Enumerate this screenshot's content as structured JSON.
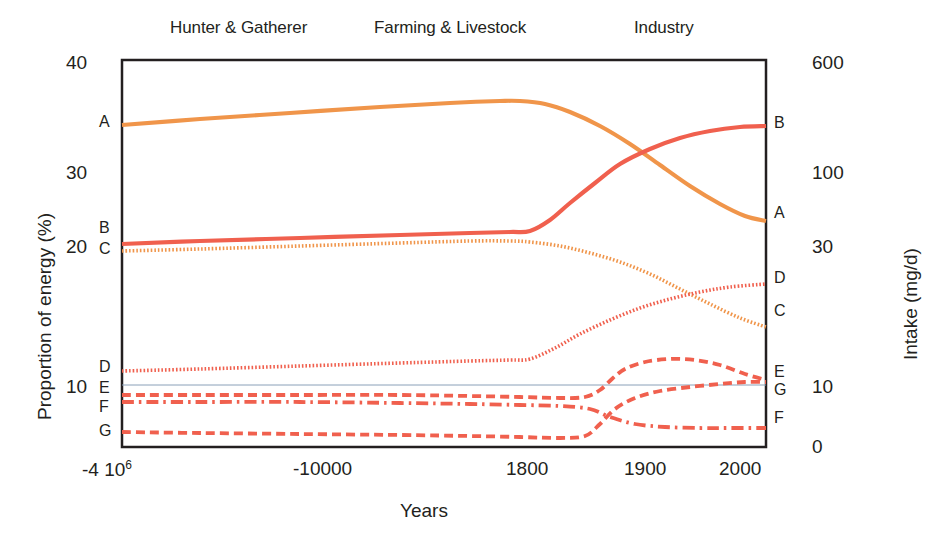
{
  "figure": {
    "era_labels": [
      {
        "text": "Hunter & Gatherer",
        "x": 170,
        "y": 18
      },
      {
        "text": "Farming & Livestock",
        "x": 374,
        "y": 18
      },
      {
        "text": "Industry",
        "x": 634,
        "y": 18
      }
    ],
    "axis_titles": {
      "x": "Years",
      "y_left": "Proportion of energy (%)",
      "y_right": "Intake (mg/d)"
    },
    "colors": {
      "orange": "#F0954A",
      "red": "#F0604E",
      "axis": "#231f20",
      "gridline": "#8aa0b8",
      "background": "#ffffff"
    }
  },
  "chart_data": {
    "type": "line",
    "title": "",
    "xlabel": "Years",
    "ylabel": "Proportion of energy (%)",
    "ylabel_right": "Intake (mg/d)",
    "grid": "single horizontal gridline at left-axis value 10",
    "legend": "inline labels at left and right edge of plot frame",
    "x_tick_labels": [
      "-4 10⁶",
      "-10000",
      "1800",
      "1900",
      "2000"
    ],
    "x_tick_positions_px": [
      122,
      330,
      530,
      650,
      745
    ],
    "y_left_ticks": [
      10,
      20,
      30,
      40
    ],
    "y_left_tick_px": [
      385,
      245,
      172,
      62
    ],
    "ylim_left": [
      0,
      40
    ],
    "y_right_ticks": [
      0,
      10,
      30,
      100,
      600
    ],
    "y_right_tick_px": [
      447,
      385,
      245,
      172,
      62
    ],
    "ylim_right": [
      0,
      600
    ],
    "era_bands": [
      "Hunter & Gatherer",
      "Farming & Livestock",
      "Industry"
    ],
    "series": [
      {
        "name": "A",
        "style": "solid",
        "color": "#F0954A",
        "left_label": "A",
        "right_label": "A",
        "left_label_y_px": 122,
        "right_label_y_px": 213,
        "start_value": 35.3,
        "end_value": 24.0,
        "peak_value": 36.5,
        "points": [
          [
            122,
            125
          ],
          [
            200,
            119
          ],
          [
            290,
            113
          ],
          [
            380,
            107
          ],
          [
            450,
            103
          ],
          [
            500,
            101
          ],
          [
            520,
            101
          ],
          [
            545,
            104
          ],
          [
            570,
            112
          ],
          [
            600,
            126
          ],
          [
            630,
            144
          ],
          [
            660,
            165
          ],
          [
            690,
            186
          ],
          [
            720,
            204
          ],
          [
            745,
            216
          ],
          [
            766,
            221
          ]
        ]
      },
      {
        "name": "B",
        "style": "solid",
        "color": "#F0604E",
        "left_label": "B",
        "right_label": "B",
        "left_label_y_px": 228,
        "right_label_y_px": 123,
        "start_value": 20.6,
        "end_value": 35.2,
        "points": [
          [
            122,
            244
          ],
          [
            200,
            241
          ],
          [
            300,
            238
          ],
          [
            400,
            235
          ],
          [
            470,
            233
          ],
          [
            510,
            232
          ],
          [
            530,
            231
          ],
          [
            550,
            220
          ],
          [
            570,
            203
          ],
          [
            595,
            183
          ],
          [
            620,
            164
          ],
          [
            650,
            149
          ],
          [
            680,
            138
          ],
          [
            710,
            131
          ],
          [
            740,
            127
          ],
          [
            766,
            126
          ]
        ]
      },
      {
        "name": "C",
        "style": "dotted",
        "color": "#F0954A",
        "left_label": "C",
        "right_label": "C",
        "left_label_y_px": 249,
        "right_label_y_px": 311,
        "start_value": 20.0,
        "end_value": 14.6,
        "points": [
          [
            122,
            251
          ],
          [
            200,
            249
          ],
          [
            300,
            246
          ],
          [
            400,
            243
          ],
          [
            470,
            241
          ],
          [
            510,
            241
          ],
          [
            530,
            242
          ],
          [
            560,
            246
          ],
          [
            590,
            253
          ],
          [
            620,
            262
          ],
          [
            650,
            274
          ],
          [
            680,
            289
          ],
          [
            710,
            304
          ],
          [
            740,
            318
          ],
          [
            766,
            327
          ]
        ]
      },
      {
        "name": "D",
        "style": "dotted",
        "color": "#F0604E",
        "left_label": "D",
        "right_label": "D",
        "left_label_y_px": 367,
        "right_label_y_px": 278,
        "start_value": 10.7,
        "end_value": 17.6,
        "points": [
          [
            122,
            371
          ],
          [
            200,
            369
          ],
          [
            300,
            366
          ],
          [
            400,
            363
          ],
          [
            470,
            361
          ],
          [
            510,
            360
          ],
          [
            530,
            359
          ],
          [
            555,
            348
          ],
          [
            580,
            334
          ],
          [
            610,
            320
          ],
          [
            640,
            308
          ],
          [
            670,
            299
          ],
          [
            700,
            292
          ],
          [
            730,
            287
          ],
          [
            766,
            284
          ]
        ]
      },
      {
        "name": "E",
        "style": "dashed",
        "color": "#F0604E",
        "left_label": "E",
        "right_label": "E",
        "left_label_y_px": 388,
        "right_label_y_px": 372,
        "start_value": 8.2,
        "end_value": 10.1,
        "peak_value": 11.3,
        "points": [
          [
            122,
            395
          ],
          [
            200,
            395
          ],
          [
            300,
            395
          ],
          [
            400,
            395
          ],
          [
            470,
            396
          ],
          [
            520,
            397
          ],
          [
            560,
            398
          ],
          [
            585,
            397
          ],
          [
            600,
            390
          ],
          [
            613,
            378
          ],
          [
            625,
            369
          ],
          [
            645,
            362
          ],
          [
            670,
            359
          ],
          [
            695,
            360
          ],
          [
            720,
            365
          ],
          [
            745,
            374
          ],
          [
            766,
            380
          ]
        ]
      },
      {
        "name": "F",
        "style": "dash-dot",
        "color": "#F0604E",
        "left_label": "F",
        "right_label": "F",
        "left_label_y_px": 407,
        "right_label_y_px": 418,
        "start_value": 8.0,
        "end_value": 2.5,
        "points": [
          [
            122,
            402
          ],
          [
            200,
            402
          ],
          [
            300,
            402
          ],
          [
            400,
            403
          ],
          [
            470,
            404
          ],
          [
            520,
            405
          ],
          [
            560,
            406
          ],
          [
            590,
            409
          ],
          [
            610,
            417
          ],
          [
            635,
            424
          ],
          [
            665,
            427
          ],
          [
            700,
            428
          ],
          [
            730,
            428
          ],
          [
            766,
            428
          ]
        ]
      },
      {
        "name": "G",
        "style": "dashed",
        "color": "#F0604E",
        "left_label": "G",
        "right_label": "G",
        "left_label_y_px": 431,
        "right_label_y_px": 390,
        "start_value": 2.3,
        "end_value": 9.8,
        "points": [
          [
            122,
            432
          ],
          [
            200,
            433
          ],
          [
            300,
            434
          ],
          [
            400,
            435
          ],
          [
            470,
            436
          ],
          [
            520,
            437
          ],
          [
            560,
            438
          ],
          [
            585,
            436
          ],
          [
            600,
            424
          ],
          [
            615,
            409
          ],
          [
            635,
            398
          ],
          [
            660,
            391
          ],
          [
            690,
            387
          ],
          [
            720,
            384
          ],
          [
            745,
            382
          ],
          [
            766,
            382
          ]
        ]
      }
    ]
  }
}
